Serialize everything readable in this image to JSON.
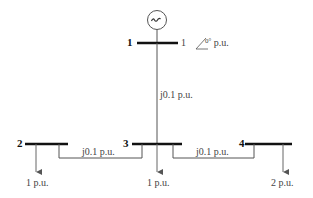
{
  "diagram": {
    "type": "power-system-one-line",
    "generator": {
      "symbol": "~",
      "bus": "1"
    },
    "buses": [
      {
        "id": "1",
        "label": "1",
        "voltage": "1∠0° p.u."
      },
      {
        "id": "2",
        "label": "2"
      },
      {
        "id": "3",
        "label": "3"
      },
      {
        "id": "4",
        "label": "4"
      }
    ],
    "lines": [
      {
        "from": "1",
        "to": "3",
        "impedance": "j0.1 p.u."
      },
      {
        "from": "2",
        "to": "3",
        "impedance": "j0.1 p.u."
      },
      {
        "from": "3",
        "to": "4",
        "impedance": "j0.1 p.u."
      }
    ],
    "loads": [
      {
        "bus": "2",
        "value": "1 p.u."
      },
      {
        "bus": "3",
        "value": "1 p.u."
      },
      {
        "bus": "4",
        "value": "2 p.u."
      }
    ]
  }
}
